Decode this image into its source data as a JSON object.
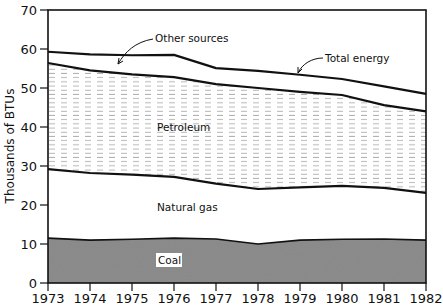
{
  "chart_data": {
    "type": "area",
    "title": "",
    "xlabel": "",
    "ylabel": "Thousands of BTUs",
    "x": [
      1973,
      1974,
      1975,
      1976,
      1977,
      1978,
      1979,
      1980,
      1981,
      1982
    ],
    "ylim": [
      0,
      70
    ],
    "yticks": [
      0,
      10,
      20,
      30,
      40,
      50,
      60,
      70
    ],
    "grid": false,
    "stacked": true,
    "series": [
      {
        "name": "Coal",
        "values": [
          11.5,
          11.0,
          11.2,
          11.5,
          11.3,
          10.0,
          11.0,
          11.2,
          11.3,
          11.0
        ],
        "fill": "stipple-dark"
      },
      {
        "name": "Natural gas",
        "cumulative_top": [
          29.2,
          28.2,
          27.8,
          27.2,
          25.5,
          24.1,
          24.5,
          24.9,
          24.4,
          23.1
        ],
        "fill": "white"
      },
      {
        "name": "Petroleum",
        "cumulative_top": [
          56.4,
          54.5,
          53.5,
          52.8,
          51.0,
          50.0,
          49.0,
          48.2,
          45.6,
          44.0
        ],
        "fill": "dashed-hatch"
      },
      {
        "name": "Other sources",
        "cumulative_top": [
          59.3,
          58.6,
          58.4,
          58.5,
          55.1,
          54.4,
          53.4,
          52.3,
          50.4,
          48.5
        ],
        "fill": "white"
      }
    ],
    "total_line": {
      "name": "Total energy",
      "values": [
        59.3,
        58.6,
        58.4,
        58.5,
        55.1,
        54.4,
        53.4,
        52.3,
        50.4,
        48.5
      ]
    },
    "annotations": [
      {
        "text": "Other sources",
        "points_to": "band between petroleum and total energy near 1974"
      },
      {
        "text": "Total energy",
        "points_to": "total line near 1979"
      },
      {
        "text": "Petroleum"
      },
      {
        "text": "Natural gas"
      },
      {
        "text": "Coal"
      }
    ]
  },
  "labels": {
    "ylabel": "Thousands of BTUs",
    "other_sources": "Other sources",
    "total_energy": "Total energy",
    "petroleum": "Petroleum",
    "natural_gas": "Natural gas",
    "coal": "Coal"
  }
}
